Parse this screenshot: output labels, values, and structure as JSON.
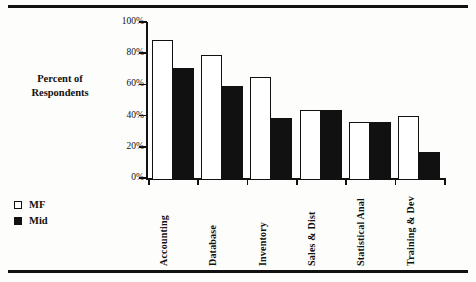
{
  "chart_data": {
    "type": "bar",
    "title": "",
    "xlabel": "",
    "ylabel": "Percent of Respondents",
    "categories": [
      "Accounting",
      "Database",
      "Inventory",
      "Sales & Dist",
      "Statistical Anal",
      "Training & Dev"
    ],
    "series": [
      {
        "name": "MF",
        "values": [
          90,
          80,
          66,
          45,
          37.5,
          41
        ]
      },
      {
        "name": "Mid",
        "values": [
          72,
          60,
          40,
          45,
          37.5,
          18
        ]
      }
    ],
    "ylim": [
      0,
      100
    ],
    "ytick_labels": [
      "100%",
      "80%",
      "60%",
      "40%",
      "20%",
      "0%"
    ],
    "ytick_values": [
      100,
      80,
      60,
      40,
      20,
      0
    ],
    "grid": false,
    "legend_position": "lower-left",
    "colors": {
      "mf": "#ffffff",
      "mid": "#111111",
      "axis": "#111111"
    }
  },
  "axis": {
    "y_title_line1": "Percent of",
    "y_title_line2": "Respondents"
  },
  "legend": {
    "entries": [
      {
        "label": "MF",
        "swatch": "hollow-square"
      },
      {
        "label": "Mid",
        "swatch": "filled-square"
      }
    ]
  },
  "page": {
    "top_cut_text": ""
  }
}
